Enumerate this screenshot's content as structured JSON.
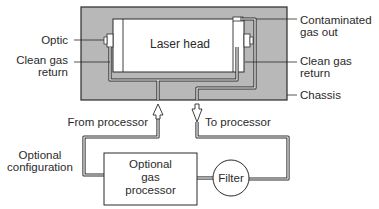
{
  "diagram": {
    "colors": {
      "chassis_fill": "#b8b8b8",
      "outline": "#2a2a2a",
      "white": "#ffffff"
    },
    "components": {
      "laser_head": "Laser head",
      "processor_line1": "Optional",
      "processor_line2": "gas",
      "processor_line3": "processor",
      "filter": "Filter"
    },
    "labels": {
      "optic": "Optic",
      "clean_gas_return_left_1": "Clean gas",
      "clean_gas_return_left_2": "return",
      "contaminated_1": "Contaminated",
      "contaminated_2": "gas out",
      "clean_gas_return_right_1": "Clean gas",
      "clean_gas_return_right_2": "return",
      "chassis": "Chassis",
      "from_processor": "From processor",
      "to_processor": "To processor",
      "optional_config_1": "Optional",
      "optional_config_2": "configuration"
    }
  }
}
